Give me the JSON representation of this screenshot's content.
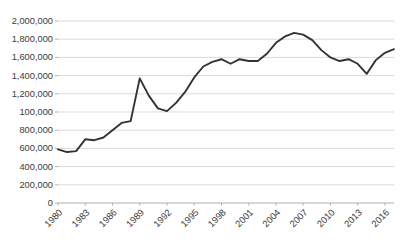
{
  "chart_data": {
    "type": "line",
    "title": "",
    "subtitle": "",
    "xlabel": "",
    "ylabel": "",
    "ylim": [
      0,
      2000000
    ],
    "xlim": [
      1980,
      2017
    ],
    "grid": "horizontal",
    "legend": "none",
    "y_tick_values": [
      0,
      200000,
      400000,
      600000,
      800000,
      1000000,
      1200000,
      1400000,
      1600000,
      1800000,
      2000000
    ],
    "y_tick_labels": [
      "0",
      "200,000",
      "400,000",
      "600,000",
      "800,000",
      "100,000",
      "1,200,000",
      "1,400,000",
      "1,600,000",
      "1,800,000",
      "2,000,000"
    ],
    "y_tick_note": "The tick at 1,000,000 is labeled '100,000' in the source chart",
    "x_tick_labels": [
      "1980",
      "1983",
      "1986",
      "1989",
      "1992",
      "1995",
      "1998",
      "2001",
      "2004",
      "2007",
      "2010",
      "2013",
      "2016"
    ],
    "x_tick_values": [
      1980,
      1983,
      1986,
      1989,
      1992,
      1995,
      1998,
      2001,
      2004,
      2007,
      2010,
      2013,
      2016
    ],
    "x_tick_rotation_deg": 45,
    "series": [
      {
        "name": "",
        "color": "#333333",
        "line_width": 1.9,
        "markers": "none",
        "x": [
          1980,
          1981,
          1982,
          1983,
          1984,
          1985,
          1986,
          1987,
          1988,
          1989,
          1990,
          1991,
          1992,
          1993,
          1994,
          1995,
          1996,
          1997,
          1998,
          1999,
          2000,
          2001,
          2002,
          2003,
          2004,
          2005,
          2006,
          2007,
          2008,
          2009,
          2010,
          2011,
          2012,
          2013,
          2014,
          2015,
          2016,
          2017
        ],
        "values": [
          590000,
          560000,
          570000,
          700000,
          690000,
          720000,
          800000,
          880000,
          900000,
          1370000,
          1180000,
          1040000,
          1010000,
          1100000,
          1220000,
          1380000,
          1500000,
          1550000,
          1580000,
          1530000,
          1580000,
          1560000,
          1560000,
          1640000,
          1760000,
          1830000,
          1870000,
          1850000,
          1790000,
          1680000,
          1600000,
          1560000,
          1580000,
          1530000,
          1420000,
          1570000,
          1650000,
          1690000
        ]
      }
    ]
  },
  "plot_geometry": {
    "left": 58,
    "right": 394,
    "top": 21,
    "bottom": 203,
    "gridline_color": "#d9d9d9",
    "axis_color": "#b0b0b0",
    "background": "#ffffff"
  }
}
